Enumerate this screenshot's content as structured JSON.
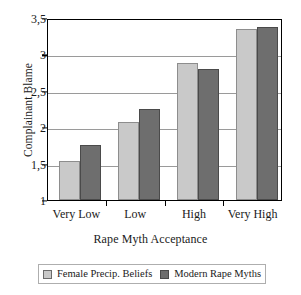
{
  "chart_data": {
    "type": "bar",
    "title": "",
    "subtitle": "",
    "xlabel": "Rape Myth Acceptance",
    "ylabel": "Complainant Blame",
    "categories": [
      "Very Low",
      "Low",
      "High",
      "Very High"
    ],
    "series": [
      {
        "name": "Female Precip. Beliefs",
        "color": "#c9c9c9",
        "values": [
          1.54,
          2.07,
          2.88,
          3.35
        ]
      },
      {
        "name": "Modern Rape Myths",
        "color": "#6e6e6e",
        "values": [
          1.75,
          2.25,
          2.8,
          3.37
        ]
      }
    ],
    "ylim": [
      1,
      3.5
    ],
    "ytick_values": [
      1,
      1.5,
      2,
      2.5,
      3,
      3.5
    ],
    "ytick_labels": [
      "1",
      "1,5",
      "2",
      "2,5",
      "3",
      "3,5"
    ],
    "gridline_values": [
      1.5,
      2,
      2.5,
      3
    ],
    "grid": true,
    "legend_position": "bottom",
    "decimal_separator": ","
  },
  "legend": {
    "entries": [
      {
        "label": "Female Precip. Beliefs",
        "swatch": "legend-swatch-light"
      },
      {
        "label": "Modern Rape Myths",
        "swatch": "legend-swatch-dark"
      }
    ]
  }
}
